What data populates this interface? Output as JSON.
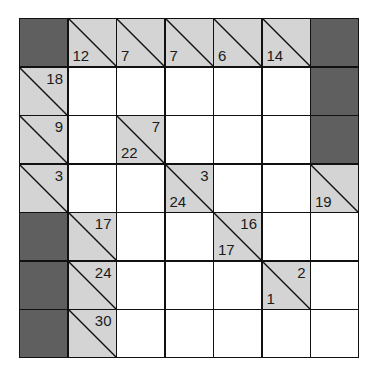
{
  "puzzle": {
    "type": "kakuro",
    "rows": 7,
    "cols": 7,
    "colors": {
      "clue": "#d4d4d4",
      "blocked": "#5f5f5f",
      "empty": "#ffffff",
      "line": "#111111"
    },
    "grid": [
      [
        {
          "t": "X"
        },
        {
          "t": "C",
          "down": "12"
        },
        {
          "t": "C",
          "down": "7"
        },
        {
          "t": "C",
          "down": "7"
        },
        {
          "t": "C",
          "down": "6"
        },
        {
          "t": "C",
          "down": "14"
        },
        {
          "t": "X"
        }
      ],
      [
        {
          "t": "C",
          "right": "18"
        },
        {
          "t": "W"
        },
        {
          "t": "W"
        },
        {
          "t": "W"
        },
        {
          "t": "W"
        },
        {
          "t": "W"
        },
        {
          "t": "X"
        }
      ],
      [
        {
          "t": "C",
          "right": "9"
        },
        {
          "t": "W"
        },
        {
          "t": "C",
          "down": "22",
          "right": "7"
        },
        {
          "t": "W"
        },
        {
          "t": "W"
        },
        {
          "t": "W"
        },
        {
          "t": "X"
        }
      ],
      [
        {
          "t": "C",
          "right": "3"
        },
        {
          "t": "W"
        },
        {
          "t": "W"
        },
        {
          "t": "C",
          "down": "24",
          "right": "3"
        },
        {
          "t": "W"
        },
        {
          "t": "W"
        },
        {
          "t": "C",
          "down": "19"
        }
      ],
      [
        {
          "t": "X"
        },
        {
          "t": "C",
          "right": "17"
        },
        {
          "t": "W"
        },
        {
          "t": "W"
        },
        {
          "t": "C",
          "down": "17",
          "right": "16"
        },
        {
          "t": "W"
        },
        {
          "t": "W"
        }
      ],
      [
        {
          "t": "X"
        },
        {
          "t": "C",
          "right": "24"
        },
        {
          "t": "W"
        },
        {
          "t": "W"
        },
        {
          "t": "W"
        },
        {
          "t": "C",
          "down": "1",
          "right": "2"
        },
        {
          "t": "W"
        }
      ],
      [
        {
          "t": "X"
        },
        {
          "t": "C",
          "right": "30"
        },
        {
          "t": "W"
        },
        {
          "t": "W"
        },
        {
          "t": "W"
        },
        {
          "t": "W"
        },
        {
          "t": "W"
        }
      ]
    ]
  }
}
